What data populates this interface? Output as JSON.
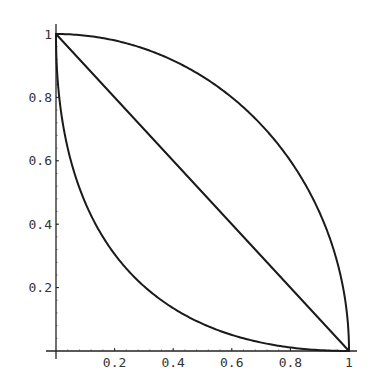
{
  "chart_data": {
    "type": "line",
    "title": "",
    "xlabel": "",
    "ylabel": "",
    "xlim": [
      0,
      1
    ],
    "ylim": [
      0,
      1
    ],
    "grid": false,
    "legend": null,
    "x_ticks": [
      {
        "value": 0.2,
        "label": "0.2"
      },
      {
        "value": 0.4,
        "label": "0.4"
      },
      {
        "value": 0.6,
        "label": "0.6"
      },
      {
        "value": 0.8,
        "label": "0.8"
      },
      {
        "value": 1.0,
        "label": "1"
      }
    ],
    "y_ticks": [
      {
        "value": 0.2,
        "label": "0.2"
      },
      {
        "value": 0.4,
        "label": "0.4"
      },
      {
        "value": 0.6,
        "label": "0.6"
      },
      {
        "value": 0.8,
        "label": "0.8"
      },
      {
        "value": 1.0,
        "label": "1"
      }
    ],
    "series": [
      {
        "name": "upper-curve",
        "description": "quarter circle x^2 + y^2 = 1",
        "x": [
          0,
          0.1,
          0.2,
          0.3,
          0.4,
          0.5,
          0.6,
          0.7,
          0.8,
          0.9,
          0.95,
          0.98,
          1.0
        ],
        "y": [
          1,
          0.995,
          0.98,
          0.954,
          0.917,
          0.866,
          0.8,
          0.714,
          0.6,
          0.436,
          0.312,
          0.199,
          0
        ]
      },
      {
        "name": "diagonal-line",
        "description": "x + y = 1",
        "x": [
          0,
          1
        ],
        "y": [
          1,
          0
        ]
      },
      {
        "name": "lower-curve",
        "description": "sqrt(x) + sqrt(y) = 1",
        "x": [
          0,
          0.005,
          0.02,
          0.04,
          0.08,
          0.12,
          0.2,
          0.3,
          0.4,
          0.5,
          0.6,
          0.7,
          0.8,
          0.9,
          1.0
        ],
        "y": [
          1,
          0.864,
          0.737,
          0.64,
          0.514,
          0.427,
          0.306,
          0.205,
          0.135,
          0.086,
          0.05,
          0.027,
          0.011,
          0.003,
          0
        ]
      }
    ]
  }
}
